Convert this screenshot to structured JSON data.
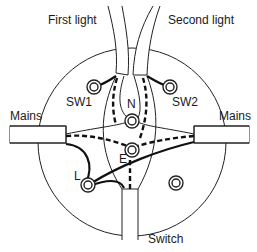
{
  "diagram": {
    "type": "ceiling rose wiring diagram",
    "labels": {
      "first_light": "First light",
      "second_light": "Second light",
      "mains_left": "Mains",
      "mains_right": "Mains",
      "switch": "Switch"
    },
    "terminals": {
      "sw1": "SW1",
      "sw2": "SW2",
      "neutral": "N",
      "earth": "E",
      "live": "L"
    },
    "colors": {
      "line": "#111111",
      "background": "#ffffff"
    }
  }
}
